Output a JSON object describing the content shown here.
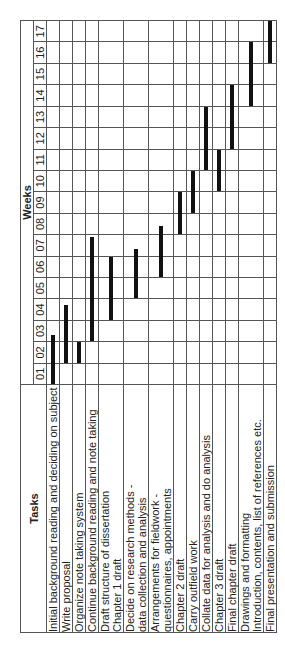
{
  "header": {
    "tasks_label": "Tasks",
    "weeks_label": "Weeks"
  },
  "weeks": [
    "01",
    "02",
    "03",
    "04",
    "05",
    "06",
    "07",
    "08",
    "09",
    "10",
    "11",
    "12",
    "13",
    "14",
    "15",
    "16",
    "17"
  ],
  "tasks": [
    {
      "lines": [
        "Initial background reading and deciding on subject"
      ],
      "start": 0.0,
      "end": 2.3
    },
    {
      "lines": [
        "Write proposal"
      ],
      "start": 1.0,
      "end": 3.7
    },
    {
      "lines": [
        "Organize note taking system"
      ],
      "start": 1.0,
      "end": 2.0
    },
    {
      "lines": [
        "Continue background reading and note taking"
      ],
      "start": 2.0,
      "end": 6.9
    },
    {
      "lines": [
        "Draft structure of dissertation",
        "Chapter 1 draft"
      ],
      "start": 3.0,
      "end": 6.0
    },
    {
      "lines": [
        "Decide on research methods -",
        "data collection and analysis"
      ],
      "start": 4.0,
      "end": 6.3
    },
    {
      "lines": [
        "Arrangements for fieldwork -",
        "questionnaires, appointments"
      ],
      "start": 5.0,
      "end": 7.4
    },
    {
      "lines": [
        "Chapter 2 draft"
      ],
      "start": 7.0,
      "end": 9.0
    },
    {
      "lines": [
        "Carry outfield work"
      ],
      "start": 8.0,
      "end": 10.0
    },
    {
      "lines": [
        "Collate data for analysis and do analysis"
      ],
      "start": 10.0,
      "end": 13.0
    },
    {
      "lines": [
        "Chapter 3 draft"
      ],
      "start": 9.0,
      "end": 11.0
    },
    {
      "lines": [
        "Final chapter draft"
      ],
      "start": 11.0,
      "end": 14.0
    },
    {
      "lines": [
        "Drawings and formatting",
        "Introduction, contents, list of references etc."
      ],
      "start": 13.0,
      "end": 16.0
    },
    {
      "lines": [
        "Final presentation and submission"
      ],
      "start": 15.0,
      "end": 17.0
    }
  ],
  "chart_data": {
    "type": "gantt",
    "title": "",
    "orientation": "rotated 90 degrees counter-clockwise",
    "xlabel": "Weeks",
    "ylabel": "Tasks",
    "categories": [
      "Initial background reading and deciding on subject",
      "Write proposal",
      "Organize note taking system",
      "Continue background reading and note taking",
      "Draft structure of dissertation / Chapter 1 draft",
      "Decide on research methods - data collection and analysis",
      "Arrangements for fieldwork - questionnaires, appointments",
      "Chapter 2 draft",
      "Carry outfield work",
      "Collate data for analysis and do analysis",
      "Chapter 3 draft",
      "Final chapter draft",
      "Drawings and formatting / Introduction, contents, list of references etc.",
      "Final presentation and submission"
    ],
    "x_ticks": [
      "01",
      "02",
      "03",
      "04",
      "05",
      "06",
      "07",
      "08",
      "09",
      "10",
      "11",
      "12",
      "13",
      "14",
      "15",
      "16",
      "17"
    ],
    "xlim": [
      0,
      17
    ],
    "grid": true,
    "series": [
      {
        "name": "start_week",
        "values": [
          0.0,
          1.0,
          1.0,
          2.0,
          3.0,
          4.0,
          5.0,
          7.0,
          8.0,
          10.0,
          9.0,
          11.0,
          13.0,
          15.0
        ]
      },
      {
        "name": "end_week",
        "values": [
          2.3,
          3.7,
          2.0,
          6.9,
          6.0,
          6.3,
          7.4,
          9.0,
          10.0,
          13.0,
          11.0,
          14.0,
          16.0,
          17.0
        ]
      }
    ]
  }
}
